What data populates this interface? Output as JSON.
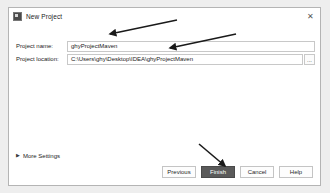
{
  "window": {
    "title": "New Project",
    "icon": "app-icon",
    "close_icon": "close-icon"
  },
  "form": {
    "fields": [
      {
        "label": "Project name:",
        "value": "ghyProjectMaven",
        "placeholder": ""
      },
      {
        "label": "Project location:",
        "value": "C:\\Users\\ghy\\Desktop\\IDEA\\ghyProjectMaven",
        "placeholder": ""
      }
    ],
    "browse_label": "...",
    "browse_icon": "ellipsis-icon"
  },
  "more_settings": {
    "label": "More Settings",
    "chevron_icon": "chevron-right-icon",
    "expanded": false
  },
  "footer": {
    "buttons": [
      {
        "label": "Previous",
        "primary": false
      },
      {
        "label": "Finish",
        "primary": true
      },
      {
        "label": "Cancel",
        "primary": false
      },
      {
        "label": "Help",
        "primary": false
      }
    ]
  },
  "annotations": {
    "arrows": [
      {
        "name": "arrow-to-project-name",
        "x1": 177,
        "y1": 20,
        "x2": 108,
        "y2": 35
      },
      {
        "name": "arrow-to-project-location",
        "x1": 236,
        "y1": 34,
        "x2": 168,
        "y2": 49
      },
      {
        "name": "arrow-to-finish-button",
        "x1": 198,
        "y1": 144,
        "x2": 226,
        "y2": 167
      }
    ]
  },
  "colors": {
    "dialog_background": "#ffffff",
    "page_background": "#eeeeee",
    "primary_button": "#5a5a5a",
    "border": "#c8c8c8",
    "text": "#1c1c1c"
  }
}
